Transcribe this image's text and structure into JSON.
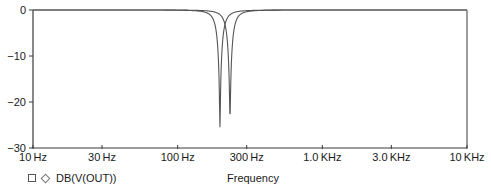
{
  "chart_data": {
    "type": "line",
    "title": "",
    "xlabel": "Frequency",
    "ylabel": "",
    "xscale": "log",
    "xlim": [
      10,
      10000
    ],
    "ylim": [
      -30,
      0
    ],
    "grid": false,
    "legend_position": "bottom-left",
    "x_ticks": [
      10,
      30,
      100,
      300,
      1000,
      3000,
      10000
    ],
    "x_tick_labels": [
      "10 Hz",
      "30 Hz",
      "100 Hz",
      "300 Hz",
      "1.0 KHz",
      "3.0 KHz",
      "10 KHz"
    ],
    "y_ticks": [
      0,
      -10,
      -20,
      -30
    ],
    "y_tick_labels": [
      "0",
      "−10",
      "−20",
      "−30"
    ],
    "legend": [
      {
        "markers": [
          "square",
          "diamond"
        ],
        "label": "DB(V(OUT))"
      }
    ],
    "series": [
      {
        "name": "DB(V(OUT)) notch 1",
        "f0": 196,
        "min_db": -25.5,
        "q": 6,
        "x": [
          10,
          100,
          150,
          175,
          185,
          190,
          194,
          196,
          198,
          202,
          210,
          225,
          260,
          350,
          1000,
          10000
        ],
        "values": [
          0,
          -0.1,
          -0.6,
          -2.0,
          -4.0,
          -6.5,
          -12.0,
          -25.5,
          -14.0,
          -8.0,
          -4.2,
          -1.9,
          -0.6,
          -0.2,
          0,
          0
        ]
      },
      {
        "name": "DB(V(OUT)) notch 2",
        "f0": 230,
        "min_db": -23.3,
        "q": 6,
        "x": [
          10,
          100,
          170,
          200,
          215,
          222,
          227,
          230,
          233,
          238,
          250,
          270,
          310,
          400,
          1000,
          10000
        ],
        "values": [
          0,
          -0.05,
          -0.5,
          -1.8,
          -4.0,
          -6.8,
          -12.0,
          -23.3,
          -13.0,
          -7.5,
          -4.0,
          -1.8,
          -0.6,
          -0.2,
          0,
          0
        ]
      }
    ]
  },
  "colors": {
    "axis": "#3a3a3a",
    "trace": "#555555",
    "background": "#ffffff"
  },
  "plot_area": {
    "left": 33,
    "right": 467,
    "top": 10,
    "bottom": 148
  }
}
